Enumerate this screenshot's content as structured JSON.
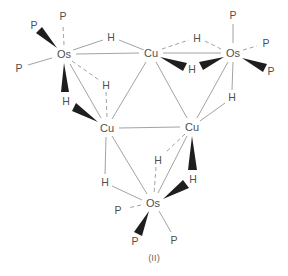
{
  "figure": {
    "caption": "(II)",
    "colors": {
      "bond": "#a3a3a3",
      "wedge": "#1e1e1e",
      "label": "#4f4f4f",
      "background": "#ffffff"
    },
    "atoms": {
      "os_top_left": "Os",
      "cu_top": "Cu",
      "os_top_right": "Os",
      "cu_left": "Cu",
      "cu_right": "Cu",
      "os_bottom": "Os",
      "h_bridge_ostl_cut": "H",
      "h_bridge_cut_ostr_back": "H",
      "h_bridge_cut_ostr_front": "H",
      "h_bridge_ostl_cul_back": "H",
      "h_bridge_ostl_cul_front": "H",
      "h_bridge_cul_osb": "H",
      "h_bridge_cur_osb_back": "H",
      "h_bridge_cur_osb_front": "H",
      "h_bridge_ostr_cur": "H",
      "p_ostl_axial": "P",
      "p_ostl_front": "P",
      "p_ostl_left": "P",
      "p_ostr_axial": "P",
      "p_ostr_back": "P",
      "p_ostr_front": "P",
      "p_osb_back": "P",
      "p_osb_front": "P",
      "p_osb_right": "P"
    }
  }
}
